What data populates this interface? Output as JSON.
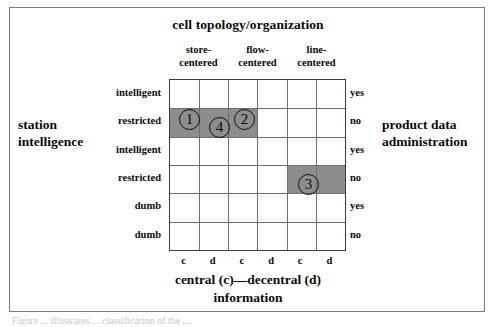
{
  "figure": {
    "top_title": "cell topology/organization",
    "left_caption": [
      "station",
      "intelligence"
    ],
    "right_caption": [
      "product data",
      "administration"
    ],
    "bottom_caption": [
      "central (c)—decentral (d)",
      "information"
    ],
    "page_caption": "Figure ... illustrates ... classification of the ...",
    "column_groups": [
      {
        "lines": [
          "store-",
          "centered"
        ]
      },
      {
        "lines": [
          "flow-",
          "centered"
        ]
      },
      {
        "lines": [
          "line-",
          "centered"
        ]
      }
    ],
    "row_labels": [
      "intelligent",
      "restricted",
      "intelligent",
      "restricted",
      "dumb",
      "dumb"
    ],
    "yesno_labels": [
      "yes",
      "no",
      "yes",
      "no",
      "yes",
      "no"
    ],
    "cd_ticks": [
      "c",
      "d",
      "c",
      "d",
      "c",
      "d"
    ],
    "shade_color": "#8d8d8d",
    "grid": {
      "columns": 6,
      "rows": 6,
      "shaded_cells": [
        {
          "row": 1,
          "col": 0
        },
        {
          "row": 1,
          "col": 1
        },
        {
          "row": 1,
          "col": 2
        },
        {
          "row": 3,
          "col": 4
        },
        {
          "row": 3,
          "col": 5
        }
      ]
    },
    "markers": [
      {
        "label": "1",
        "left": 169,
        "top": 101
      },
      {
        "label": "4",
        "left": 199,
        "top": 109
      },
      {
        "label": "2",
        "left": 224,
        "top": 101
      },
      {
        "label": "3",
        "left": 288,
        "top": 166
      }
    ]
  }
}
